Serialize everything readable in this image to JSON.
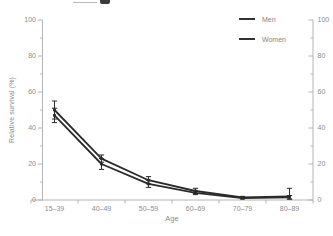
{
  "chart_data": {
    "type": "line",
    "categories": [
      "15–39",
      "40–49",
      "50–59",
      "60–69",
      "70–79",
      "80–89"
    ],
    "series": [
      {
        "name": "Men",
        "values": [
          50,
          23,
          11,
          5,
          1.5,
          2
        ],
        "err_low": [
          45,
          21,
          9,
          3.5,
          1,
          0.5
        ],
        "err_high": [
          55,
          25,
          13,
          6.5,
          2,
          6.5
        ],
        "color": "#2b2b2b"
      },
      {
        "name": "Women",
        "values": [
          47,
          20,
          9,
          4,
          1,
          1.5
        ],
        "err_low": [
          43,
          17,
          7,
          3,
          0.5,
          0.5
        ],
        "err_high": [
          51,
          23,
          11,
          5,
          1.5,
          2.5
        ],
        "color": "#2b2b2b"
      }
    ],
    "xlabel": "Age",
    "ylabel": "Relative survival (%)",
    "ylim": [
      0,
      100
    ],
    "y_ticks": [
      0,
      20,
      40,
      60,
      80,
      100
    ],
    "y_minor_ticks": [
      10,
      30,
      50,
      70,
      90
    ],
    "right_axis_ticks": [
      0,
      20,
      40,
      60,
      80,
      100
    ],
    "grid": false,
    "error_bars": true,
    "legend_position": "top-right",
    "axis_color": "#b4b4b4",
    "label_color": "#8c8c8c"
  }
}
